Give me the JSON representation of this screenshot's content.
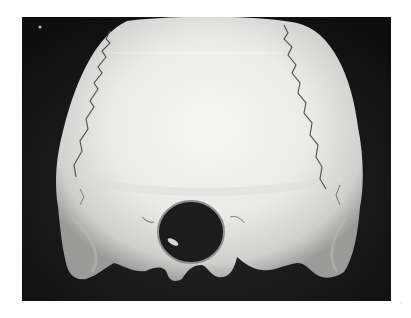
{
  "photo": {
    "subject": "human skull, posterior-inferior view",
    "background_color": "#111111",
    "page_color": "#ffffff",
    "bone_color": "#e8e8e6",
    "shadow_color": "#9a9a98",
    "features": [
      "lambdoid-suture-left",
      "lambdoid-suture-right",
      "foramen-magnum",
      "mastoid-process-left",
      "mastoid-process-right"
    ]
  },
  "artifacts": {
    "scan_mark": "ʼ"
  }
}
